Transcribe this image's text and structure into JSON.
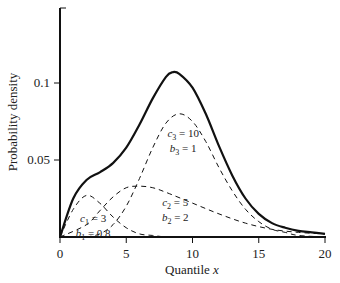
{
  "chart_data": {
    "type": "line",
    "title": "",
    "xlabel": "Quantile x",
    "ylabel": "Probability density",
    "xlim": [
      0,
      20
    ],
    "ylim": [
      0,
      0.15
    ],
    "xticks": [
      "0",
      "5",
      "10",
      "15",
      "20"
    ],
    "yticks": [
      "0.05",
      "0.1"
    ],
    "grid": false,
    "legend": "none",
    "series": [
      {
        "name": "mixture",
        "style": "solid",
        "x": [
          0,
          1,
          2,
          3,
          4,
          5,
          6,
          7,
          8,
          8.5,
          9,
          10,
          11,
          12,
          13,
          14,
          15,
          16,
          17,
          18,
          19,
          20
        ],
        "values": [
          0,
          0.025,
          0.037,
          0.042,
          0.048,
          0.058,
          0.073,
          0.09,
          0.104,
          0.107,
          0.106,
          0.097,
          0.08,
          0.059,
          0.04,
          0.025,
          0.015,
          0.009,
          0.006,
          0.004,
          0.003,
          0.002
        ]
      },
      {
        "name": "c1 = 3, b1 = 0.8",
        "style": "dashed",
        "x": [
          0,
          1,
          2,
          3,
          4,
          5,
          6,
          7,
          8,
          9,
          10
        ],
        "values": [
          0,
          0.018,
          0.027,
          0.022,
          0.013,
          0.006,
          0.002,
          0.001,
          0,
          0,
          0
        ]
      },
      {
        "name": "c2 = 5, b2 = 2",
        "style": "dashed",
        "x": [
          0,
          2,
          3,
          4,
          5,
          6,
          7,
          8,
          10,
          12,
          14,
          16,
          18,
          20
        ],
        "values": [
          0,
          0.008,
          0.017,
          0.026,
          0.032,
          0.033,
          0.032,
          0.029,
          0.022,
          0.015,
          0.009,
          0.005,
          0.003,
          0.002
        ]
      },
      {
        "name": "c3 = 10, b3 = 1",
        "style": "dashed",
        "x": [
          2,
          3,
          4,
          5,
          6,
          7,
          8,
          9,
          10,
          11,
          12,
          13,
          14,
          15,
          16,
          17,
          18,
          20
        ],
        "values": [
          0,
          0.002,
          0.008,
          0.02,
          0.038,
          0.058,
          0.074,
          0.08,
          0.075,
          0.062,
          0.045,
          0.03,
          0.018,
          0.01,
          0.005,
          0.003,
          0.001,
          0
        ]
      }
    ],
    "annotations": [
      {
        "text_c": "c",
        "sub_c": "3",
        "rest_c": " = 10",
        "text_b": "b",
        "sub_b": "3",
        "rest_b": " = 1",
        "x": 9.3,
        "y": 0.065
      },
      {
        "text_c": "c",
        "sub_c": "2",
        "rest_c": " = 5",
        "text_b": "b",
        "sub_b": "2",
        "rest_b": " = 2",
        "x": 8.7,
        "y": 0.02
      },
      {
        "text_c": "c",
        "sub_c": "1",
        "rest_c": " = 3",
        "text_b": "b",
        "sub_b": "1",
        "rest_b": " = 0.8",
        "x": 2.5,
        "y": 0.01
      }
    ]
  }
}
